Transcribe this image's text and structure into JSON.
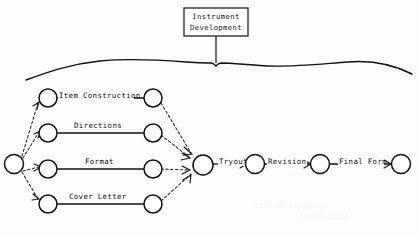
{
  "figure": {
    "type": "flow-network-diagram",
    "callout": {
      "line1": "Instrument",
      "line2": "Development"
    },
    "start_node": {
      "id": "start",
      "label": ""
    },
    "merge_node": {
      "id": "merge",
      "label": ""
    },
    "parallel_activities": [
      {
        "label": "Item Construction",
        "row": 1
      },
      {
        "label": "Directions",
        "row": 2
      },
      {
        "label": "Format",
        "row": 3
      },
      {
        "label": "Cover Letter",
        "row": 4
      }
    ],
    "chain_activities": [
      {
        "label": "Tryout"
      },
      {
        "label": "Revision"
      },
      {
        "label": "Final Form"
      }
    ],
    "colors": {
      "ink": "#111111",
      "paper": "#fdfdfd"
    }
  }
}
